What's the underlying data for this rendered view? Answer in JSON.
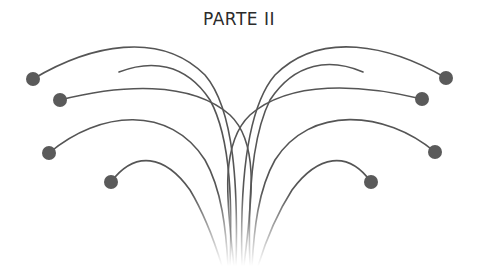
{
  "title": "PARTE II",
  "colors": {
    "stroke": "#555555",
    "dot": "#5a5a5a",
    "background": "#ffffff"
  },
  "strands": [
    {
      "id": "left-1",
      "side": "left",
      "has_dot": true,
      "end": [
        33,
        79
      ],
      "path": "M33,79 C90,45 160,30 205,75 C235,110 238,190 236,266"
    },
    {
      "id": "left-2",
      "side": "left",
      "has_dot": false,
      "end": [
        119,
        72
      ],
      "path": "M119,72 C150,60 185,62 210,100 C232,140 232,210 230,266"
    },
    {
      "id": "left-3",
      "side": "left",
      "has_dot": true,
      "end": [
        60,
        100
      ],
      "path": "M60,100 C120,85 190,80 230,115 C262,145 250,210 244,266"
    },
    {
      "id": "left-4",
      "side": "left",
      "has_dot": true,
      "end": [
        49,
        153
      ],
      "path": "M49,153 C100,110 170,105 205,160 C222,190 226,230 228,266"
    },
    {
      "id": "left-5",
      "side": "left",
      "has_dot": true,
      "end": [
        111,
        182
      ],
      "path": "M111,182 C135,150 165,155 190,190 C205,215 214,240 222,266"
    },
    {
      "id": "right-1",
      "side": "right",
      "has_dot": true,
      "end": [
        446,
        78
      ],
      "path": "M446,78 C390,45 320,30 275,75 C245,110 240,190 242,266"
    },
    {
      "id": "right-2",
      "side": "right",
      "has_dot": false,
      "end": [
        363,
        72
      ],
      "path": "M363,72 C330,58 295,62 270,100 C250,140 248,210 250,266"
    },
    {
      "id": "right-3",
      "side": "right",
      "has_dot": true,
      "end": [
        422,
        99
      ],
      "path": "M422,99 C360,84 290,80 250,115 C218,145 228,210 234,266"
    },
    {
      "id": "right-4",
      "side": "right",
      "has_dot": true,
      "end": [
        435,
        152
      ],
      "path": "M435,152 C385,110 310,105 275,160 C258,190 254,230 252,266"
    },
    {
      "id": "right-5",
      "side": "right",
      "has_dot": true,
      "end": [
        371,
        182
      ],
      "path": "M371,182 C348,150 318,155 292,190 C276,215 266,240 258,266"
    }
  ],
  "dot_radius": 7
}
